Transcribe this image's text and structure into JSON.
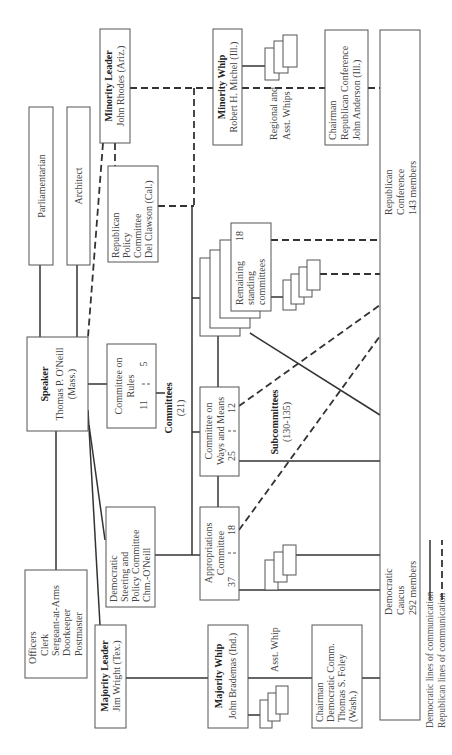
{
  "diagram": {
    "orientation": "rotated 90deg counter-clockwise",
    "nodes": {
      "parliamentarian": {
        "lines": [
          "Parliamentarian"
        ]
      },
      "architect": {
        "lines": [
          "Architect"
        ]
      },
      "minority_leader": {
        "title": "Minority Leader",
        "lines": [
          "John Rhodes (Ariz.)"
        ]
      },
      "minority_whip": {
        "title": "Minority Whip",
        "lines": [
          "Robert H. Michel (Ill.)"
        ]
      },
      "regional_whips": {
        "lines": [
          "Regional and",
          "Asst. Whips"
        ]
      },
      "chairman_rep_conf": {
        "lines": [
          "Chairman",
          "Republican Conference",
          "John Anderson (Ill.)"
        ]
      },
      "republican_conference": {
        "lines": [
          "Republican",
          "Conference",
          "143 members"
        ]
      },
      "republican_policy": {
        "lines": [
          "Republican",
          "Policy",
          "Committee",
          "Del Clawson (Cal.)"
        ]
      },
      "remaining_committees": {
        "lines": [
          "Remaining",
          "standing",
          "committees"
        ],
        "count": "18"
      },
      "speaker": {
        "title": "Speaker",
        "lines": [
          "Thomas P. O'Neill",
          "(Mass.)"
        ]
      },
      "rules_committee": {
        "lines": [
          "Committee on",
          "Rules"
        ],
        "dem": "11",
        "rep": "5"
      },
      "committees_label": {
        "title": "Committees",
        "count": "(21)"
      },
      "ways_and_means": {
        "lines": [
          "Committee on",
          "Ways and Means"
        ],
        "dem": "25",
        "rep": "12"
      },
      "subcommittees_label": {
        "title": "Subcommittees",
        "count": "(130-135)"
      },
      "appropriations": {
        "lines": [
          "Appropriations",
          "Committee"
        ],
        "dem": "37",
        "rep": "18"
      },
      "dem_steering": {
        "lines": [
          "Democratic",
          "Steering and",
          "Policy Committee",
          "Chm.-O'Neill"
        ]
      },
      "officers": {
        "lines": [
          "Officers",
          "Clerk",
          "Sergeant-at-Arms",
          "Doorkeeper",
          "Postmaster"
        ]
      },
      "majority_leader": {
        "title": "Majority Leader",
        "lines": [
          "Jim Wright (Tex.)"
        ]
      },
      "majority_whip": {
        "title": "Majority Whip",
        "lines": [
          "John Brademas (Ind.)"
        ]
      },
      "asst_whip": {
        "lines": [
          "Asst. Whip"
        ]
      },
      "chairman_dem_comm": {
        "lines": [
          "Chairman",
          "Democratic Comm.",
          "Thomas S. Foley",
          "(Wash.)"
        ]
      },
      "democratic_caucus": {
        "lines": [
          "Democratic",
          "Caucus",
          "292 members"
        ]
      }
    },
    "legend": {
      "democratic": "Democratic lines of communication",
      "republican": "Republican lines of communication"
    },
    "colors": {
      "line": "#333333",
      "box_border": "#555555",
      "text": "#444444",
      "background": "#ffffff"
    }
  }
}
